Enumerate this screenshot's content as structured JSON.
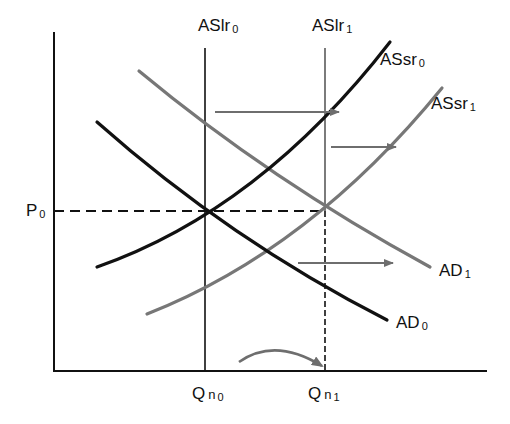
{
  "diagram": {
    "type": "aggregate-supply-aggregate-demand",
    "colors": {
      "original_curves": "#111111",
      "shifted_curves": "#777777",
      "arrows": "#6e6e6e",
      "axes": "#111111"
    },
    "axes": {
      "y_label": "P",
      "y_label_sub": "0",
      "x_ticks": [
        {
          "main": "Q",
          "sub_n": "n",
          "sub": "0"
        },
        {
          "main": "Q",
          "sub_n": "n",
          "sub": "1"
        }
      ]
    },
    "curves": {
      "aslr0": {
        "main": "ASlr",
        "sub": "0"
      },
      "aslr1": {
        "main": "ASlr",
        "sub": "1"
      },
      "assr0": {
        "main": "ASsr",
        "sub": "0"
      },
      "assr1": {
        "main": "ASsr",
        "sub": "1"
      },
      "ad0": {
        "main": "AD",
        "sub": "0"
      },
      "ad1": {
        "main": "AD",
        "sub": "1"
      }
    },
    "arrows": [
      {
        "from": "ASlr0",
        "to": "ASlr1",
        "direction": "right"
      },
      {
        "from": "ASsr0",
        "to": "ASsr1",
        "direction": "right"
      },
      {
        "from": "AD0",
        "to": "AD1",
        "direction": "right"
      },
      {
        "from": "Qn0",
        "to": "Qn1",
        "direction": "right",
        "style": "curved"
      }
    ],
    "equilibria": [
      {
        "price": "P0",
        "quantity": "Qn0",
        "curves": [
          "AD0",
          "ASsr0",
          "ASlr0"
        ]
      },
      {
        "price": "P0",
        "quantity": "Qn1",
        "curves": [
          "AD1",
          "ASsr1",
          "ASlr1"
        ]
      }
    ]
  }
}
